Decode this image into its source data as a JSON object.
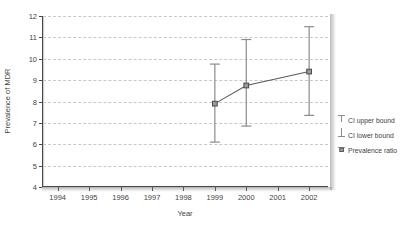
{
  "chart_data": {
    "type": "line",
    "title": "",
    "subtitle": "",
    "xlabel": "Year",
    "ylabel": "Prevalence of MDR",
    "xlim": [
      1993.5,
      2002.6
    ],
    "ylim": [
      4,
      12
    ],
    "yticks": [
      4,
      5,
      6,
      7,
      8,
      9,
      10,
      11,
      12
    ],
    "xticks": [
      1994,
      1995,
      1996,
      1997,
      1998,
      1999,
      2000,
      2001,
      2002
    ],
    "categories": [
      "1994",
      "1995",
      "1996",
      "1997",
      "1998",
      "1999",
      "2000",
      "2001",
      "2002"
    ],
    "grid": "horizontal-dashed",
    "legend_position": "right",
    "series": [
      {
        "name": "Prevalence ratio",
        "x": [
          1999,
          2000,
          2002
        ],
        "values": [
          7.9,
          8.75,
          9.4
        ],
        "ci_lower": [
          6.1,
          6.85,
          7.35
        ],
        "ci_upper": [
          9.75,
          10.9,
          11.5
        ],
        "marker": "square",
        "color": "#5a5a5a"
      }
    ],
    "legend": [
      {
        "label": "CI upper bound",
        "glyph": "error-bar-upper"
      },
      {
        "label": "CI lower bound",
        "glyph": "error-bar-lower"
      },
      {
        "label": "Prevalence ratio",
        "glyph": "square-marker"
      }
    ],
    "colors": {
      "line": "#5a5a5a",
      "marker_fill": "#9a9a9a",
      "marker_edge": "#3f3f3f",
      "error_bar": "#8c8c8c",
      "grid": "#c9c9c9",
      "axis": "#4a4a4a",
      "text": "#3f3f3f",
      "background": "#ffffff"
    }
  }
}
